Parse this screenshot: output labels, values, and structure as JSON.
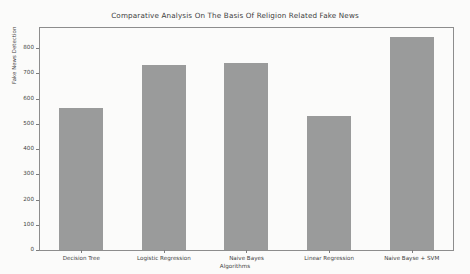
{
  "chart_data": {
    "type": "bar",
    "title": "Comparative Analysis On The Basis Of Religion Related Fake News",
    "xlabel": "Algorithms",
    "ylabel": "Fake News Detection",
    "categories": [
      "Decision Tree",
      "Logistic Regression",
      "Naive Bayes",
      "Linear Regression",
      "Naive Bayse + SVM"
    ],
    "values": [
      562,
      732,
      742,
      533,
      845
    ],
    "ylim": [
      0,
      880
    ],
    "yticks": [
      0,
      100,
      200,
      300,
      400,
      500,
      600,
      700,
      800
    ],
    "ytick_labels": [
      "0",
      "100",
      "200",
      "300",
      "400",
      "500",
      "600",
      "700",
      "800"
    ],
    "grid": false,
    "legend": null,
    "bar_color": "#9a9b9b",
    "background_color": "#fbfbfa",
    "axis_color": "#8d8d8d"
  }
}
